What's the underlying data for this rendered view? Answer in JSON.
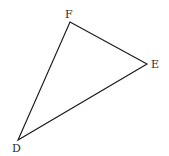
{
  "diagram": {
    "type": "triangle",
    "stroke_color": "#1e1e1e",
    "background": "#ffffff",
    "vertices": [
      {
        "name": "F",
        "x": 70,
        "y": 22,
        "label_x": 65,
        "label_y": 18
      },
      {
        "name": "E",
        "x": 147,
        "y": 64,
        "label_x": 151,
        "label_y": 68
      },
      {
        "name": "D",
        "x": 18,
        "y": 140,
        "label_x": 12,
        "label_y": 152
      }
    ],
    "edges": [
      [
        "F",
        "E"
      ],
      [
        "E",
        "D"
      ],
      [
        "D",
        "F"
      ]
    ]
  }
}
